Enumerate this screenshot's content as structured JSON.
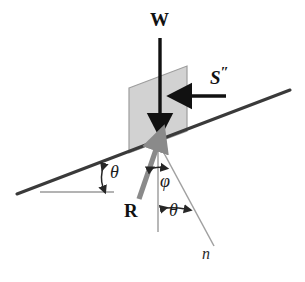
{
  "figure": {
    "type": "physics-force-diagram",
    "background_color": "#ffffff"
  },
  "labels": {
    "weight": "W",
    "shear_force": "S",
    "shear_force_primes": "″",
    "reaction": "R",
    "normal_direction": "n",
    "incline_angle": "θ",
    "friction_angle": "φ",
    "normal_offset_angle": "θ"
  },
  "colors": {
    "block_fill": "#d2d2d2",
    "block_stroke": "#9a9a9a",
    "incline_line": "#3a3a3a",
    "arrow_black": "#111111",
    "arrow_gray": "#8a8a8a",
    "thin_gray": "#8f8f8f",
    "horizontal_ref": "#8f8f8f"
  },
  "geometry": {
    "incline": {
      "x1": 17,
      "y1": 194,
      "x2": 290,
      "y2": 90,
      "angle_deg": 20.8
    },
    "horizontal_reference": {
      "x1": 40,
      "y1": 192,
      "x2": 114,
      "y2": 192
    },
    "block": {
      "corner_bottom_left": {
        "x": 129,
        "y": 153
      },
      "corner_top_left": {
        "x": 129,
        "y": 88
      },
      "corner_top_right": {
        "x": 187,
        "y": 66
      },
      "corner_bottom_right": {
        "x": 187,
        "y": 131
      }
    },
    "contact_point": {
      "x": 158,
      "y": 142
    },
    "weight_arrow": {
      "x1": 160,
      "y1": 38,
      "x2": 160,
      "y2": 120,
      "direction": "down"
    },
    "shear_arrow": {
      "x1": 226,
      "y1": 96,
      "x2": 184,
      "y2": 96,
      "direction": "left"
    },
    "reaction_arrow": {
      "x1": 140,
      "y1": 198,
      "x2": 159,
      "y2": 142,
      "direction": "up-right"
    },
    "vertical_line": {
      "x1": 158,
      "y1": 142,
      "x2": 158,
      "y2": 232
    },
    "normal_line": {
      "x1": 158,
      "y1": 142,
      "x2": 214,
      "y2": 246
    }
  },
  "label_positions": {
    "weight": {
      "x": 150,
      "y": 12
    },
    "shear_force": {
      "x": 212,
      "y": 68
    },
    "reaction": {
      "x": 125,
      "y": 203
    },
    "normal_direction": {
      "x": 203,
      "y": 248
    },
    "incline_angle": {
      "x": 110,
      "y": 164
    },
    "friction_angle": {
      "x": 162,
      "y": 173
    },
    "normal_offset_angle": {
      "x": 170,
      "y": 202
    }
  },
  "annotations": {
    "incline_angle_desc": "angle between inclined surface and horizontal",
    "friction_angle_desc": "angle between reaction R and the surface normal n",
    "normal_offset_angle_desc": "angle between vertical and the normal direction n"
  }
}
